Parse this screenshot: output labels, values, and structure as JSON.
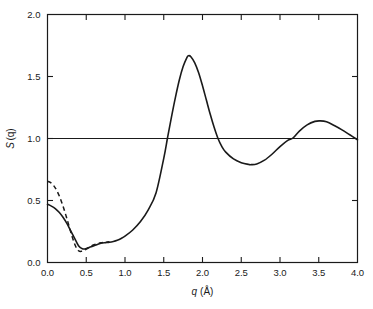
{
  "chart_data": {
    "type": "line",
    "title": "",
    "xlabel": "q (Å)",
    "xlabel_symbol": "q",
    "xlabel_unit": "(Å)",
    "ylabel": "S(q)",
    "ylabel_symbol": "S",
    "ylabel_arg": "(q)",
    "xlim": [
      0.0,
      4.0
    ],
    "ylim": [
      0.0,
      2.0
    ],
    "xticks": [
      0.0,
      0.5,
      1.0,
      1.5,
      2.0,
      2.5,
      3.0,
      3.5,
      4.0
    ],
    "xtick_labels": [
      "0.0",
      "0.5",
      "1.0",
      "1.5",
      "2.0",
      "2.5",
      "3.0",
      "3.5",
      "4.0"
    ],
    "yticks": [
      0.0,
      0.5,
      1.0,
      1.5,
      2.0
    ],
    "ytick_labels": [
      "0.0",
      "0.5",
      "1.0",
      "1.5",
      "2.0"
    ],
    "grid": false,
    "legend": "none",
    "reference_lines": [
      {
        "name": "unity-line",
        "axis": "y",
        "value": 1.0,
        "style": "solid"
      }
    ],
    "annotations": [
      {
        "name": "main-peak",
        "x": 1.82,
        "y": 1.67,
        "label": ""
      },
      {
        "name": "first-minimum",
        "x": 0.43,
        "y": 0.1,
        "label": ""
      },
      {
        "name": "second-minimum",
        "x": 2.63,
        "y": 0.79,
        "label": ""
      },
      {
        "name": "second-maximum",
        "x": 3.52,
        "y": 1.14,
        "label": ""
      }
    ],
    "series": [
      {
        "name": "structure-factor-solid",
        "style": "solid",
        "color": "#1a1a1a",
        "x": [
          0.0,
          0.05,
          0.1,
          0.15,
          0.2,
          0.25,
          0.3,
          0.35,
          0.4,
          0.45,
          0.5,
          0.55,
          0.6,
          0.65,
          0.7,
          0.75,
          0.8,
          0.85,
          0.9,
          0.95,
          1.0,
          1.1,
          1.2,
          1.3,
          1.4,
          1.5,
          1.55,
          1.6,
          1.65,
          1.7,
          1.75,
          1.8,
          1.82,
          1.85,
          1.9,
          1.95,
          2.0,
          2.05,
          2.1,
          2.15,
          2.2,
          2.25,
          2.3,
          2.4,
          2.5,
          2.6,
          2.63,
          2.7,
          2.8,
          2.9,
          3.0,
          3.1,
          3.17,
          3.25,
          3.35,
          3.45,
          3.52,
          3.6,
          3.7,
          3.8,
          3.9,
          4.0
        ],
        "y": [
          0.47,
          0.455,
          0.435,
          0.405,
          0.365,
          0.315,
          0.255,
          0.195,
          0.135,
          0.11,
          0.112,
          0.124,
          0.136,
          0.148,
          0.157,
          0.16,
          0.163,
          0.17,
          0.18,
          0.194,
          0.212,
          0.262,
          0.33,
          0.425,
          0.56,
          0.84,
          1.01,
          1.175,
          1.33,
          1.47,
          1.58,
          1.655,
          1.668,
          1.66,
          1.61,
          1.53,
          1.425,
          1.31,
          1.195,
          1.09,
          1.0,
          0.935,
          0.89,
          0.835,
          0.805,
          0.79,
          0.789,
          0.795,
          0.825,
          0.875,
          0.935,
          0.985,
          1.005,
          1.06,
          1.11,
          1.138,
          1.142,
          1.135,
          1.105,
          1.07,
          1.03,
          0.99
        ]
      },
      {
        "name": "structure-factor-dashed",
        "style": "dashed",
        "color": "#1a1a1a",
        "x": [
          0.0,
          0.04,
          0.08,
          0.12,
          0.16,
          0.2,
          0.24,
          0.28,
          0.32,
          0.36,
          0.4,
          0.44,
          0.48,
          0.52,
          0.56,
          0.6,
          0.65,
          0.7,
          0.75,
          0.8
        ],
        "y": [
          0.655,
          0.645,
          0.62,
          0.58,
          0.525,
          0.455,
          0.375,
          0.29,
          0.205,
          0.135,
          0.095,
          0.09,
          0.1,
          0.118,
          0.132,
          0.143,
          0.154,
          0.16,
          0.164,
          0.168
        ]
      }
    ]
  },
  "figure": {
    "background": "#ffffff",
    "foreground": "#1a1a1a"
  }
}
